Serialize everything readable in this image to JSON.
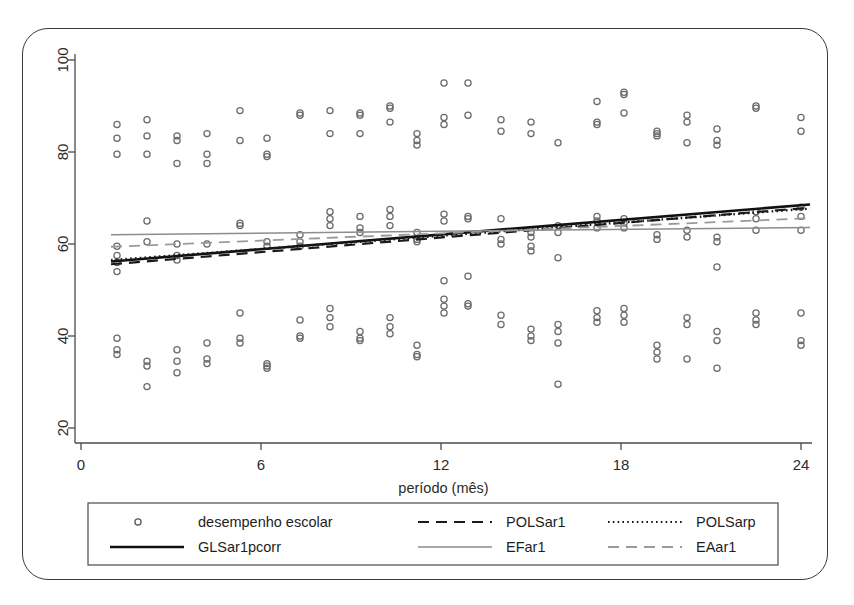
{
  "chart_data": {
    "type": "scatter",
    "title": "",
    "xlabel": "período (mês)",
    "ylabel": "",
    "xlim": [
      0,
      25
    ],
    "ylim": [
      18,
      104
    ],
    "xticks": [
      0,
      6,
      12,
      18,
      24
    ],
    "yticks": [
      20,
      40,
      60,
      80,
      100
    ],
    "grid": false,
    "legend_position": "bottom",
    "marker": "open-circle",
    "scatter": {
      "name": "desempenho escolar",
      "points": [
        [
          1.2,
          86
        ],
        [
          1.2,
          83
        ],
        [
          1.2,
          79.5
        ],
        [
          1.2,
          59.5
        ],
        [
          1.2,
          57.5
        ],
        [
          1.2,
          56
        ],
        [
          1.2,
          54
        ],
        [
          1.2,
          39.5
        ],
        [
          1.2,
          37
        ],
        [
          1.2,
          36
        ],
        [
          2.2,
          87
        ],
        [
          2.2,
          83.5
        ],
        [
          2.2,
          79.5
        ],
        [
          2.2,
          65
        ],
        [
          2.2,
          60.5
        ],
        [
          2.2,
          34.5
        ],
        [
          2.2,
          33.5
        ],
        [
          2.2,
          29
        ],
        [
          3.2,
          83.5
        ],
        [
          3.2,
          82.5
        ],
        [
          3.2,
          77.5
        ],
        [
          3.2,
          60
        ],
        [
          3.2,
          57.5
        ],
        [
          3.2,
          56.5
        ],
        [
          3.2,
          37
        ],
        [
          3.2,
          34.5
        ],
        [
          3.2,
          32
        ],
        [
          4.2,
          84
        ],
        [
          4.2,
          79.5
        ],
        [
          4.2,
          77.5
        ],
        [
          4.2,
          60
        ],
        [
          4.2,
          38.5
        ],
        [
          4.2,
          35
        ],
        [
          4.2,
          34
        ],
        [
          5.3,
          89
        ],
        [
          5.3,
          82.5
        ],
        [
          5.3,
          64.5
        ],
        [
          5.3,
          64
        ],
        [
          5.3,
          45
        ],
        [
          5.3,
          39.5
        ],
        [
          5.3,
          38.5
        ],
        [
          6.2,
          83
        ],
        [
          6.2,
          79.5
        ],
        [
          6.2,
          79
        ],
        [
          6.2,
          60.5
        ],
        [
          6.2,
          59.5
        ],
        [
          6.2,
          34
        ],
        [
          6.2,
          33.5
        ],
        [
          6.2,
          33
        ],
        [
          7.3,
          88.5
        ],
        [
          7.3,
          88
        ],
        [
          7.3,
          62
        ],
        [
          7.3,
          60.5
        ],
        [
          7.3,
          59.5
        ],
        [
          7.3,
          43.5
        ],
        [
          7.3,
          40
        ],
        [
          7.3,
          39.5
        ],
        [
          8.3,
          89
        ],
        [
          8.3,
          84
        ],
        [
          8.3,
          67
        ],
        [
          8.3,
          65.5
        ],
        [
          8.3,
          64
        ],
        [
          8.3,
          46
        ],
        [
          8.3,
          44
        ],
        [
          8.3,
          42
        ],
        [
          9.3,
          88.5
        ],
        [
          9.3,
          88
        ],
        [
          9.3,
          84
        ],
        [
          9.3,
          66
        ],
        [
          9.3,
          63.5
        ],
        [
          9.3,
          62.5
        ],
        [
          9.3,
          41
        ],
        [
          9.3,
          39.5
        ],
        [
          9.3,
          39
        ],
        [
          10.3,
          90
        ],
        [
          10.3,
          89.5
        ],
        [
          10.3,
          86.5
        ],
        [
          10.3,
          67.5
        ],
        [
          10.3,
          66
        ],
        [
          10.3,
          64
        ],
        [
          10.3,
          44
        ],
        [
          10.3,
          42
        ],
        [
          10.3,
          40.5
        ],
        [
          11.2,
          84
        ],
        [
          11.2,
          82.5
        ],
        [
          11.2,
          81.5
        ],
        [
          11.2,
          62.5
        ],
        [
          11.2,
          61
        ],
        [
          11.2,
          60.5
        ],
        [
          11.2,
          38
        ],
        [
          11.2,
          36
        ],
        [
          11.2,
          35.5
        ],
        [
          12.1,
          95
        ],
        [
          12.1,
          87.5
        ],
        [
          12.1,
          86
        ],
        [
          12.1,
          66.5
        ],
        [
          12.1,
          65
        ],
        [
          12.1,
          52
        ],
        [
          12.1,
          48
        ],
        [
          12.1,
          46.5
        ],
        [
          12.1,
          45
        ],
        [
          12.9,
          95
        ],
        [
          12.9,
          88
        ],
        [
          12.9,
          66
        ],
        [
          12.9,
          65.5
        ],
        [
          12.9,
          53
        ],
        [
          12.9,
          47
        ],
        [
          12.9,
          46.5
        ],
        [
          14.0,
          87
        ],
        [
          14.0,
          84.5
        ],
        [
          14.0,
          65.5
        ],
        [
          14.0,
          61
        ],
        [
          14.0,
          60
        ],
        [
          14.0,
          44.5
        ],
        [
          14.0,
          42.5
        ],
        [
          15.0,
          86.5
        ],
        [
          15.0,
          84
        ],
        [
          15.0,
          62.5
        ],
        [
          15.0,
          61.5
        ],
        [
          15.0,
          59.5
        ],
        [
          15.0,
          58.5
        ],
        [
          15.0,
          41.5
        ],
        [
          15.0,
          40
        ],
        [
          15.0,
          39
        ],
        [
          15.9,
          82
        ],
        [
          15.9,
          64
        ],
        [
          15.9,
          62.5
        ],
        [
          15.9,
          57
        ],
        [
          15.9,
          42.5
        ],
        [
          15.9,
          41
        ],
        [
          15.9,
          38.5
        ],
        [
          15.9,
          29.5
        ],
        [
          17.2,
          91
        ],
        [
          17.2,
          86.5
        ],
        [
          17.2,
          86
        ],
        [
          17.2,
          66
        ],
        [
          17.2,
          65
        ],
        [
          17.2,
          63.5
        ],
        [
          17.2,
          45.5
        ],
        [
          17.2,
          44
        ],
        [
          17.2,
          43
        ],
        [
          18.1,
          93
        ],
        [
          18.1,
          92.5
        ],
        [
          18.1,
          88.5
        ],
        [
          18.1,
          65.5
        ],
        [
          18.1,
          64.5
        ],
        [
          18.1,
          63.5
        ],
        [
          18.1,
          46
        ],
        [
          18.1,
          44.5
        ],
        [
          18.1,
          43
        ],
        [
          19.2,
          84.5
        ],
        [
          19.2,
          84
        ],
        [
          19.2,
          83.5
        ],
        [
          19.2,
          62
        ],
        [
          19.2,
          61
        ],
        [
          19.2,
          38
        ],
        [
          19.2,
          36.5
        ],
        [
          19.2,
          35
        ],
        [
          20.2,
          88
        ],
        [
          20.2,
          86.5
        ],
        [
          20.2,
          82
        ],
        [
          20.2,
          63
        ],
        [
          20.2,
          61.5
        ],
        [
          20.2,
          44
        ],
        [
          20.2,
          42.5
        ],
        [
          20.2,
          35
        ],
        [
          21.2,
          85
        ],
        [
          21.2,
          82.5
        ],
        [
          21.2,
          81.5
        ],
        [
          21.2,
          61.5
        ],
        [
          21.2,
          60.5
        ],
        [
          21.2,
          55
        ],
        [
          21.2,
          41
        ],
        [
          21.2,
          39
        ],
        [
          21.2,
          33
        ],
        [
          22.5,
          90
        ],
        [
          22.5,
          89.5
        ],
        [
          22.5,
          67
        ],
        [
          22.5,
          65.5
        ],
        [
          22.5,
          63
        ],
        [
          22.5,
          45
        ],
        [
          22.5,
          43.5
        ],
        [
          22.5,
          42.5
        ],
        [
          24.0,
          87.5
        ],
        [
          24.0,
          84.5
        ],
        [
          24.0,
          68
        ],
        [
          24.0,
          66
        ],
        [
          24.0,
          63
        ],
        [
          24.0,
          45
        ],
        [
          24.0,
          39
        ],
        [
          24.0,
          38
        ]
      ]
    },
    "lines": [
      {
        "name": "GLSar1pcorr",
        "style": "solid",
        "color": "#111111",
        "width": 2.6,
        "x": [
          1.0,
          24.3
        ],
        "y": [
          56.2,
          68.6
        ]
      },
      {
        "name": "POLSar1",
        "style": "dashed",
        "color": "#1a1a1a",
        "width": 2.2,
        "x": [
          1.0,
          24.3
        ],
        "y": [
          55.6,
          67.9
        ]
      },
      {
        "name": "POLSarp",
        "style": "dotted",
        "color": "#1a1a1a",
        "width": 2.4,
        "x": [
          1.0,
          24.3
        ],
        "y": [
          56.5,
          67.7
        ]
      },
      {
        "name": "EFar1",
        "style": "solid",
        "color": "#8d8d8d",
        "width": 1.5,
        "x": [
          1.0,
          24.3
        ],
        "y": [
          62.0,
          63.6
        ]
      },
      {
        "name": "EAar1",
        "style": "dashed",
        "color": "#9a9a9a",
        "width": 1.8,
        "x": [
          1.0,
          24.3
        ],
        "y": [
          59.4,
          65.6
        ]
      }
    ]
  },
  "legend": {
    "entries": [
      {
        "label": "desempenho escolar",
        "kind": "marker",
        "style": "open-circle",
        "color": "#555555"
      },
      {
        "label": "POLSar1",
        "kind": "line",
        "style": "dashed",
        "color": "#1a1a1a"
      },
      {
        "label": "POLSarp",
        "kind": "line",
        "style": "dotted",
        "color": "#1a1a1a"
      },
      {
        "label": "GLSar1pcorr",
        "kind": "line",
        "style": "solid",
        "color": "#111111"
      },
      {
        "label": "EFar1",
        "kind": "line",
        "style": "solid",
        "color": "#8d8d8d"
      },
      {
        "label": "EAar1",
        "kind": "line",
        "style": "dashed",
        "color": "#9a9a9a"
      }
    ]
  },
  "colors": {
    "axis": "#4a4a4a",
    "frame": "#3b3b3b",
    "marker_stroke": "#6b6b6b",
    "background": "#ffffff"
  }
}
